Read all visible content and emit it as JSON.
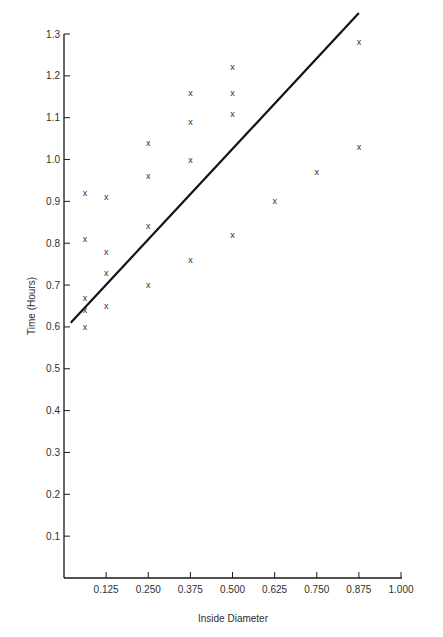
{
  "chart_data": {
    "type": "scatter",
    "title": "",
    "xlabel": "Inside Diameter",
    "ylabel": "Time (Hours)",
    "xlim": [
      0,
      1.0
    ],
    "ylim": [
      0,
      1.3
    ],
    "grid": false,
    "legend": null,
    "marker": "x",
    "x_ticks": [
      "0.125",
      "0.250",
      "0.375",
      "0.500",
      "0.625",
      "0.750",
      "0.875",
      "1.000"
    ],
    "x_tick_values": [
      0.125,
      0.25,
      0.375,
      0.5,
      0.625,
      0.75,
      0.875,
      1.0
    ],
    "y_ticks": [
      "0.1",
      "0.2",
      "0.3",
      "0.4",
      "0.5",
      "0.6",
      "0.7",
      "0.8",
      "0.9",
      "1.0",
      "1.1",
      "1.2",
      "1.3"
    ],
    "y_tick_values": [
      0.1,
      0.2,
      0.3,
      0.4,
      0.5,
      0.6,
      0.7,
      0.8,
      0.9,
      1.0,
      1.1,
      1.2,
      1.3
    ],
    "series": [
      {
        "name": "observations",
        "points": [
          [
            0.0625,
            0.92
          ],
          [
            0.0625,
            0.81
          ],
          [
            0.0625,
            0.67
          ],
          [
            0.0625,
            0.64
          ],
          [
            0.0625,
            0.6
          ],
          [
            0.125,
            0.91
          ],
          [
            0.125,
            0.78
          ],
          [
            0.125,
            0.73
          ],
          [
            0.125,
            0.65
          ],
          [
            0.25,
            1.04
          ],
          [
            0.25,
            0.96
          ],
          [
            0.25,
            0.84
          ],
          [
            0.25,
            0.7
          ],
          [
            0.375,
            1.16
          ],
          [
            0.375,
            1.09
          ],
          [
            0.375,
            1.0
          ],
          [
            0.375,
            0.76
          ],
          [
            0.5,
            1.22
          ],
          [
            0.5,
            1.16
          ],
          [
            0.5,
            1.11
          ],
          [
            0.5,
            0.82
          ],
          [
            0.625,
            0.9
          ],
          [
            0.75,
            0.97
          ],
          [
            0.875,
            1.28
          ],
          [
            0.875,
            1.03
          ]
        ]
      }
    ],
    "fit_line": {
      "name": "regression line",
      "start": [
        0.02,
        0.61
      ],
      "end": [
        0.875,
        1.35
      ]
    }
  }
}
